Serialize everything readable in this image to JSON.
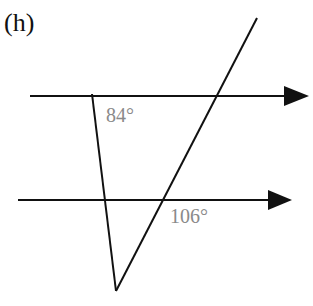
{
  "figure": {
    "label": "(h)",
    "angles": [
      {
        "id": "angle-top",
        "text": "84°"
      },
      {
        "id": "angle-bottom",
        "text": "106°"
      }
    ],
    "colors": {
      "line": "#111111",
      "angle_text": "#8a8a8a"
    }
  }
}
